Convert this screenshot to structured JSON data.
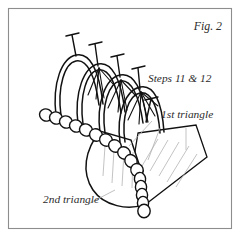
{
  "figure": {
    "caption": "Fig. 2",
    "background_color": "#ffffff",
    "ink_color": "#111111",
    "frame_color": "#8d8d8d",
    "shading_color": "#b4b4b4",
    "label_color": "#2b2b2b",
    "labels": {
      "steps": "Steps 11 & 12",
      "first_triangle": "1st triangle",
      "second_triangle": "2nd triangle"
    },
    "illustration": {
      "subject": "beaded-stitch-diagram",
      "bead_count_upper": 11,
      "bead_count_lower": 14,
      "pin_count": 5,
      "arch_count": 4,
      "panel_count": 2
    }
  }
}
